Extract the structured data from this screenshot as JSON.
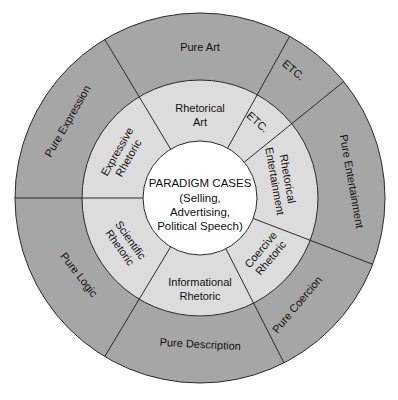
{
  "chart_data": {
    "type": "diagram",
    "title": "",
    "center": {
      "title": "PARADIGM CASES",
      "lines": [
        "(Selling,",
        "Advertising,",
        "Political Speech)"
      ]
    },
    "segments": [
      {
        "inner": [
          "Rhetorical",
          "Art"
        ],
        "outer": "Pure Art",
        "start_deg": -31,
        "end_deg": 29
      },
      {
        "inner": [
          "ETC."
        ],
        "outer": "ETC.",
        "start_deg": 29,
        "end_deg": 51
      },
      {
        "inner": [
          "Rhetorical",
          "Entertainment"
        ],
        "outer": "Pure Entertainment",
        "start_deg": 51,
        "end_deg": 111
      },
      {
        "inner": [
          "Coercive",
          "Rhetoric"
        ],
        "outer": "Pure Coercion",
        "start_deg": 111,
        "end_deg": 153
      },
      {
        "inner": [
          "Informational",
          "Rhetoric"
        ],
        "outer": "Pure Description",
        "start_deg": 153,
        "end_deg": 211
      },
      {
        "inner": [
          "Scientific",
          "Rhetoric"
        ],
        "outer": "Pure Logic",
        "start_deg": 211,
        "end_deg": 270
      },
      {
        "inner": [
          "Expressive",
          "Rhetoric"
        ],
        "outer": "Pure Expression",
        "start_deg": 270,
        "end_deg": 329
      }
    ],
    "rings": {
      "center_radius": 57,
      "middle_radius": 118,
      "outer_radius": 185
    }
  },
  "colors": {
    "outer_ring": "#a6a6a6",
    "middle_ring": "#dcdcdc",
    "center": "#ffffff",
    "line": "#2a2a2a"
  }
}
